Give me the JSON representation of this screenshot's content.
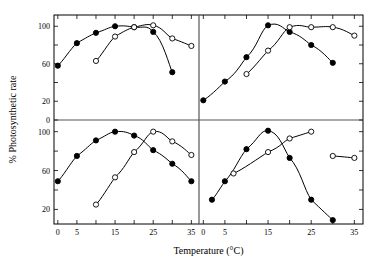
{
  "figure": {
    "xlabel": "Temperature (°C)",
    "ylabel": "% Photosynthetic rate",
    "panel_count": 4
  },
  "axes": {
    "x_ticks_major": [
      0,
      5,
      15,
      25,
      35
    ],
    "x_ticks_all": [
      0,
      5,
      10,
      15,
      20,
      25,
      30,
      35
    ],
    "x_tick_labels": [
      "0",
      "5",
      "15",
      "25",
      "35"
    ],
    "xlim": [
      -1,
      37
    ],
    "y_ticks_top": [
      0,
      20,
      40,
      60,
      80,
      100
    ],
    "y_tick_labels_top": [
      "0",
      "20",
      "60",
      "100"
    ],
    "y_labeled_top": [
      0,
      20,
      60,
      100
    ],
    "y_ticks_bottom": [
      20,
      40,
      60,
      80,
      100
    ],
    "y_tick_labels_bottom": [
      "20",
      "60",
      "100"
    ],
    "y_labeled_bottom": [
      20,
      60,
      100
    ],
    "ylim_top": [
      0,
      112
    ],
    "ylim_bottom": [
      5,
      112
    ],
    "grid": false,
    "legend": "none"
  },
  "colors": {
    "line": "#000000",
    "filled_marker": "#000000",
    "open_marker": "#ffffff",
    "divider": "#555555",
    "frame": "#000000",
    "background": "#ffffff"
  },
  "chart_data": {
    "type": "line",
    "title": "",
    "xlabel": "Temperature (°C)",
    "ylabel": "% Photosynthetic rate",
    "panels": [
      {
        "name": "top-left",
        "position": "top-left",
        "xlim": [
          -1,
          37
        ],
        "ylim": [
          0,
          112
        ],
        "series": [
          {
            "name": "filled-circles",
            "marker": "filled-circle",
            "x": [
              0,
              5,
              10,
              15,
              20,
              25,
              30
            ],
            "values": [
              58,
              82,
              93,
              100,
              99,
              94,
              51
            ]
          },
          {
            "name": "open-circles",
            "marker": "open-circle",
            "x": [
              10,
              15,
              20,
              25,
              30,
              35
            ],
            "values": [
              63,
              89,
              99,
              101,
              87,
              79
            ]
          }
        ]
      },
      {
        "name": "top-right",
        "position": "top-right",
        "xlim": [
          -1,
          37
        ],
        "ylim": [
          0,
          112
        ],
        "series": [
          {
            "name": "filled-circles",
            "marker": "filled-circle",
            "x": [
              0,
              5,
              10,
              15,
              20,
              25,
              30
            ],
            "values": [
              21,
              41,
              67,
              101,
              94,
              80,
              61
            ]
          },
          {
            "name": "open-circles",
            "marker": "open-circle",
            "x": [
              10,
              15,
              20,
              25,
              30,
              35
            ],
            "values": [
              49,
              74,
              99,
              99,
              99,
              90
            ]
          }
        ]
      },
      {
        "name": "bottom-left",
        "position": "bottom-left",
        "xlim": [
          -1,
          37
        ],
        "ylim": [
          5,
          112
        ],
        "series": [
          {
            "name": "filled-circles",
            "marker": "filled-circle",
            "x": [
              0,
              5,
              10,
              15,
              20,
              25,
              30,
              35
            ],
            "values": [
              49,
              75,
              91,
              100,
              96,
              81,
              67,
              49
            ]
          },
          {
            "name": "open-circles",
            "marker": "open-circle",
            "x": [
              10,
              15,
              20,
              25,
              30,
              35
            ],
            "values": [
              25,
              53,
              79,
              100,
              90,
              76
            ]
          }
        ]
      },
      {
        "name": "bottom-right",
        "position": "bottom-right",
        "xlim": [
          -1,
          37
        ],
        "ylim": [
          5,
          112
        ],
        "series": [
          {
            "name": "filled-circles",
            "marker": "filled-circle",
            "x": [
              2,
              5,
              10,
              15,
              20,
              25,
              30
            ],
            "values": [
              30,
              49,
              82,
              101,
              73,
              30,
              9
            ]
          },
          {
            "name": "open-circles",
            "marker": "open-circle",
            "x": [
              7,
              15,
              20,
              25,
              30,
              35
            ],
            "values": [
              57,
              79,
              93,
              100,
              75,
              73
            ]
          }
        ]
      }
    ]
  }
}
